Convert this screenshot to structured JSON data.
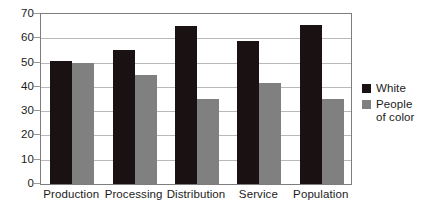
{
  "chart_data": {
    "type": "bar",
    "title": "",
    "xlabel": "",
    "ylabel": "",
    "ylim": [
      0,
      70
    ],
    "ytick_step": 10,
    "yticks": [
      0,
      10,
      20,
      30,
      40,
      50,
      60,
      70
    ],
    "grid": true,
    "legend_position": "right",
    "categories": [
      "Production",
      "Processing",
      "Distribution",
      "Service",
      "Population"
    ],
    "series": [
      {
        "name": "White",
        "color": "#1a1212",
        "values": [
          50.5,
          55,
          65,
          59,
          65.5
        ]
      },
      {
        "name": "People\nof color",
        "legend_label_line1": "People",
        "legend_label_line2": "of color",
        "color": "#808080",
        "values": [
          50,
          45,
          35,
          41.5,
          35
        ]
      }
    ]
  },
  "colors": {
    "series_white": "#1a1212",
    "series_poc": "#808080",
    "gridline": "#b9b9b9",
    "axis": "#7d7d7d",
    "background": "#ffffff",
    "text": "#1b1b1b"
  }
}
